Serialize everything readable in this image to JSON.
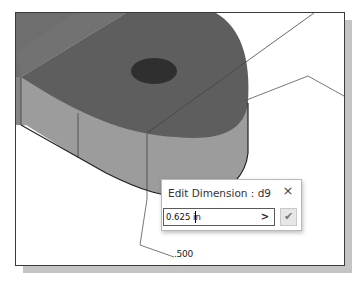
{
  "dialog": {
    "title": "Edit Dimension : d9",
    "close_icon": "×",
    "input_value": "0.625 in",
    "arrow_icon": ">",
    "ok_icon": "✔"
  },
  "model": {
    "dimension_label": ".500"
  },
  "colors": {
    "top_face": "#5a5a5a",
    "side_face": "#9a9a9a",
    "hole": "#2e2e2e",
    "leader_line": "#555555",
    "frame_border": "#3a3a3a",
    "shadow": "#c4c4c4"
  }
}
